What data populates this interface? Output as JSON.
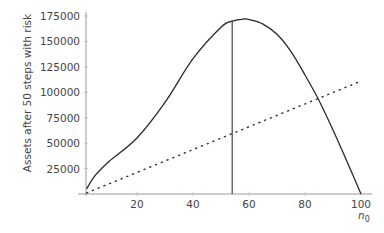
{
  "chart_data": {
    "type": "line",
    "title": "",
    "xlabel": "n",
    "xlabel_subscript": "0",
    "ylabel": "Assets after 50 steps with risk",
    "xlim": [
      0,
      100
    ],
    "ylim": [
      0,
      175000
    ],
    "x_ticks": [
      20,
      40,
      60,
      80,
      100
    ],
    "y_ticks": [
      25000,
      50000,
      75000,
      100000,
      125000,
      150000,
      175000
    ],
    "grid": false,
    "legend": null,
    "series": [
      {
        "name": "assets with risk",
        "style": "solid",
        "x": [
          2,
          5,
          10,
          20,
          30,
          40,
          50,
          54,
          58,
          60,
          65,
          70,
          75,
          80,
          85,
          90,
          95,
          100
        ],
        "values": [
          5000,
          18000,
          32000,
          55000,
          90000,
          133000,
          164000,
          170000,
          172000,
          171500,
          167000,
          157000,
          140000,
          117000,
          92000,
          63000,
          32000,
          0
        ]
      },
      {
        "name": "linear reference",
        "style": "dotted",
        "x": [
          2,
          100
        ],
        "values": [
          1000,
          111000
        ]
      }
    ],
    "annotations": [
      {
        "type": "vline",
        "x": 54,
        "ymax": 170000,
        "style": "solid"
      }
    ]
  }
}
